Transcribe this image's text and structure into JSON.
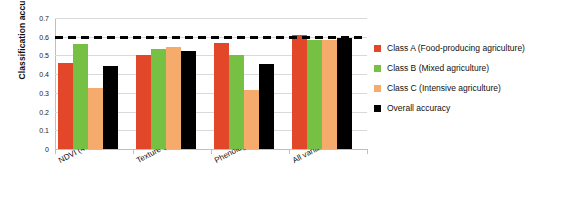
{
  "chart_data": {
    "type": "bar",
    "title": "",
    "subtitle": "",
    "xlabel": "",
    "ylabel": "Classification accuracy",
    "ylim": [
      0,
      0.7
    ],
    "yticks": [
      0,
      0.1,
      0.2,
      0.3,
      0.4,
      0.5,
      0.6,
      0.7
    ],
    "ytick_labels": [
      "0",
      "0.1",
      "0.2",
      "0.3",
      "0.4",
      "0.5",
      "0.6",
      "0.7"
    ],
    "grid": true,
    "legend_position": "right",
    "categories": [
      "NDVI (4 var.)",
      "Texture (12 var.)",
      "Phenology (7 var.)",
      "All variables (30)"
    ],
    "series": [
      {
        "name": "Class A (Food-producing agriculture)",
        "color": "#E2472A",
        "values": [
          0.46,
          0.505,
          0.565,
          0.61
        ]
      },
      {
        "name": "Class B (Mixed agriculture)",
        "color": "#76C043",
        "values": [
          0.56,
          0.535,
          0.505,
          0.585
        ]
      },
      {
        "name": "Class C (Intensive agriculture)",
        "color": "#F5AB6B",
        "values": [
          0.325,
          0.545,
          0.315,
          0.585
        ]
      },
      {
        "name": "Overall accuracy",
        "color": "#000000",
        "values": [
          0.445,
          0.525,
          0.455,
          0.595
        ]
      }
    ],
    "annotations": [
      {
        "type": "hline",
        "value": 0.6,
        "style": "dashed",
        "color": "#000000",
        "label": ""
      }
    ]
  },
  "legend": {
    "items": [
      {
        "label": "Class A (Food-producing agriculture)",
        "color": "#E2472A",
        "marker": "square-swatch-icon"
      },
      {
        "label": "Class B (Mixed agriculture)",
        "color": "#76C043",
        "marker": "square-swatch-icon"
      },
      {
        "label": "Class C (Intensive agriculture)",
        "color": "#F5AB6B",
        "marker": "square-swatch-icon"
      },
      {
        "label": "Overall accuracy",
        "color": "#000000",
        "marker": "square-swatch-icon"
      }
    ]
  }
}
